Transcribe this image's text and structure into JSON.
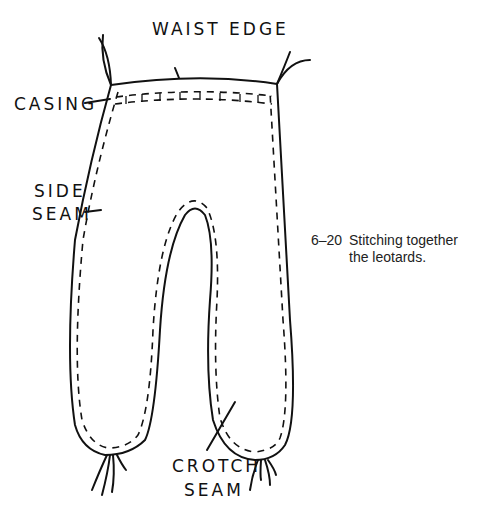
{
  "diagram": {
    "labels": {
      "waist_edge": "WAIST EDGE",
      "casing": "CASING",
      "side_seam_1": "SIDE",
      "side_seam_2": "SEAM",
      "crotch_seam_1": "CROTCH",
      "crotch_seam_2": "SEAM"
    },
    "caption": {
      "number": "6–20",
      "text": "Stitching together the leotards."
    },
    "colors": {
      "line": "#111111",
      "background": "#ffffff"
    }
  }
}
